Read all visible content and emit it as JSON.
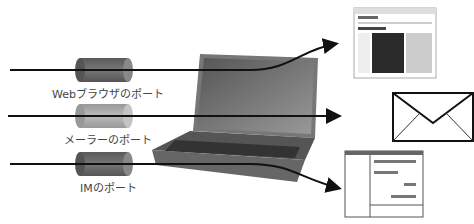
{
  "ports": [
    {
      "label": "Webブラウザのポート",
      "shade": "dark"
    },
    {
      "label": "メーラーのポート",
      "shade": "light"
    },
    {
      "label": "IMのポート",
      "shade": "dark"
    }
  ],
  "destinations": {
    "browser": {
      "site_title": "ネットワークの基礎"
    },
    "mail": {},
    "im": {}
  },
  "colors": {
    "cyl_dark": "#6a6a6a",
    "cyl_light": "#a8a8a8",
    "line": "#111111",
    "laptop": "#707070"
  }
}
